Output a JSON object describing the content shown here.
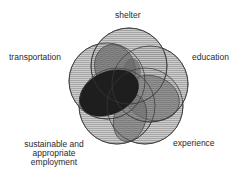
{
  "diagram": {
    "type": "venn",
    "sets": [
      {
        "id": "shelter",
        "label": "shelter"
      },
      {
        "id": "transportation",
        "label": "transportation"
      },
      {
        "id": "education",
        "label": "education"
      },
      {
        "id": "employment",
        "label": "sustainable and appropriate employment",
        "lines": [
          "sustainable and",
          "appropriate",
          "employment"
        ]
      },
      {
        "id": "experience",
        "label": "experience"
      }
    ],
    "colors": {
      "fill_light": "#b8b8b8",
      "hatch": "#8c8c8c",
      "overlap_medium": "#6e6e6e",
      "overlap_dark": "#1e1e1e",
      "stroke": "#3a3a3a"
    }
  }
}
